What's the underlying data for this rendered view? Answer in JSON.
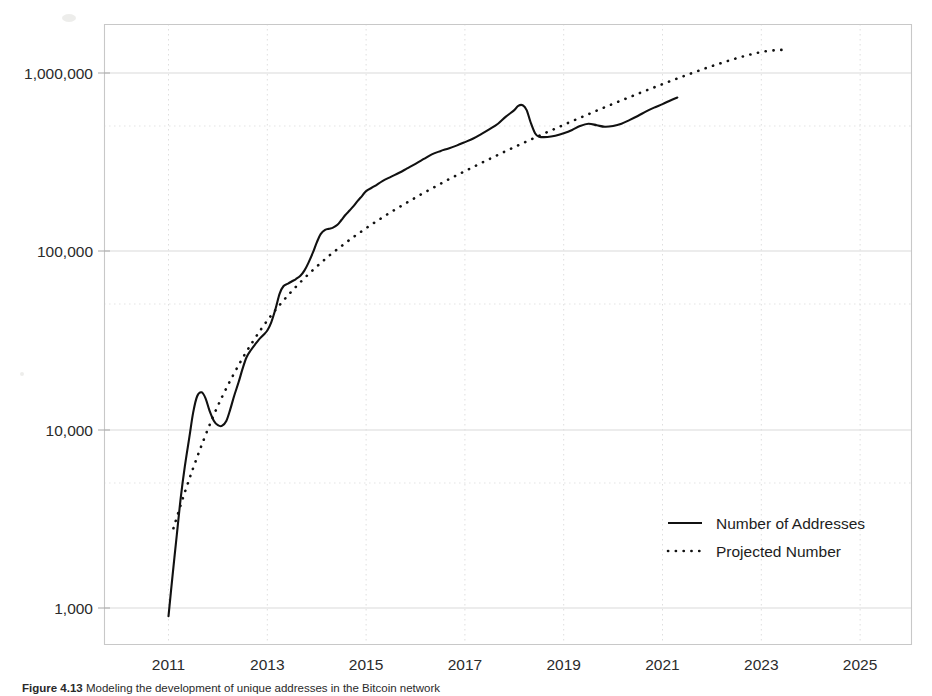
{
  "figure": {
    "caption_label": "Figure 4.13",
    "caption_body": "Modeling the development of unique addresses in the Bitcoin network"
  },
  "legend": {
    "position": "inside-bottom-right",
    "entries": [
      {
        "label": "Number of Addresses",
        "style": "solid",
        "color": "#111111"
      },
      {
        "label": "Projected Number",
        "style": "dotted",
        "color": "#111111"
      }
    ]
  },
  "chart_data": {
    "type": "line",
    "title": "",
    "xlabel": "",
    "ylabel": "",
    "yscale": "log",
    "grid": true,
    "legend_position": "inside-bottom-right",
    "xlim": [
      2010.2,
      2026.0
    ],
    "ylim": [
      620,
      2300000
    ],
    "xticks": [
      "2011",
      "2013",
      "2015",
      "2017",
      "2019",
      "2021",
      "2023",
      "2025"
    ],
    "xtick_values": [
      2011,
      2013,
      2015,
      2017,
      2019,
      2021,
      2023,
      2025
    ],
    "ytick_labels": [
      "1,000",
      "10,000",
      "100,000",
      "1,000,000"
    ],
    "ytick_values": [
      1000,
      10000,
      100000,
      1000000
    ],
    "series": [
      {
        "name": "Number of Addresses",
        "style": "solid",
        "color": "#111111",
        "x": [
          2011.0,
          2011.08,
          2011.17,
          2011.25,
          2011.33,
          2011.42,
          2011.5,
          2011.58,
          2011.67,
          2011.75,
          2011.83,
          2011.92,
          2012.0,
          2012.08,
          2012.17,
          2012.25,
          2012.33,
          2012.42,
          2012.5,
          2012.58,
          2012.67,
          2012.75,
          2012.83,
          2012.92,
          2013.0,
          2013.08,
          2013.17,
          2013.25,
          2013.33,
          2013.42,
          2013.5,
          2013.58,
          2013.67,
          2013.75,
          2013.83,
          2013.92,
          2014.0,
          2014.08,
          2014.17,
          2014.25,
          2014.33,
          2014.42,
          2014.5,
          2014.58,
          2014.67,
          2014.75,
          2014.83,
          2014.92,
          2015.0,
          2015.17,
          2015.33,
          2015.5,
          2015.67,
          2015.83,
          2016.0,
          2016.17,
          2016.33,
          2016.5,
          2016.67,
          2016.83,
          2017.0,
          2017.17,
          2017.33,
          2017.5,
          2017.67,
          2017.83,
          2018.0,
          2018.08,
          2018.17,
          2018.25,
          2018.33,
          2018.42,
          2018.5,
          2018.67,
          2018.83,
          2019.0,
          2019.17,
          2019.33,
          2019.5,
          2019.67,
          2019.83,
          2020.0,
          2020.17,
          2020.33,
          2020.5,
          2020.67,
          2020.83,
          2021.0,
          2021.17,
          2021.3
        ],
        "y": [
          900,
          1500,
          2600,
          4200,
          6200,
          9000,
          12500,
          15400,
          16200,
          15000,
          12800,
          11200,
          10600,
          10500,
          11200,
          13000,
          15500,
          18500,
          22000,
          25500,
          28000,
          30000,
          32000,
          34000,
          36000,
          40000,
          48000,
          58000,
          64000,
          66000,
          68000,
          70000,
          73000,
          78000,
          86000,
          98000,
          112000,
          125000,
          132000,
          134000,
          136000,
          141000,
          150000,
          160000,
          170000,
          180000,
          192000,
          205000,
          218000,
          232000,
          248000,
          262000,
          276000,
          292000,
          310000,
          330000,
          350000,
          365000,
          378000,
          392000,
          410000,
          430000,
          455000,
          485000,
          520000,
          570000,
          620000,
          655000,
          660000,
          620000,
          530000,
          460000,
          440000,
          438000,
          445000,
          460000,
          480000,
          505000,
          520000,
          510000,
          500000,
          505000,
          520000,
          545000,
          575000,
          610000,
          640000,
          670000,
          705000,
          730000
        ]
      },
      {
        "name": "Projected Number",
        "style": "dotted",
        "color": "#111111",
        "x": [
          2011.1,
          2011.3,
          2011.5,
          2011.7,
          2011.9,
          2012.1,
          2012.3,
          2012.5,
          2012.7,
          2012.9,
          2013.1,
          2013.3,
          2013.5,
          2013.7,
          2013.9,
          2014.1,
          2014.3,
          2014.5,
          2014.7,
          2014.9,
          2015.1,
          2015.3,
          2015.5,
          2015.7,
          2015.9,
          2016.1,
          2016.3,
          2016.5,
          2016.7,
          2016.9,
          2017.1,
          2017.3,
          2017.5,
          2017.7,
          2017.9,
          2018.1,
          2018.3,
          2018.5,
          2018.7,
          2018.9,
          2019.1,
          2019.3,
          2019.5,
          2019.7,
          2019.9,
          2020.1,
          2020.3,
          2020.5,
          2020.7,
          2020.9,
          2021.1,
          2021.3,
          2021.5,
          2021.7,
          2021.9,
          2022.1,
          2022.3,
          2022.5,
          2022.7,
          2022.9,
          2023.1,
          2023.3,
          2023.45
        ],
        "y": [
          2800,
          4200,
          6100,
          8600,
          11800,
          15600,
          20000,
          25200,
          31000,
          37500,
          44500,
          52000,
          60000,
          68500,
          77500,
          87000,
          97000,
          107000,
          118000,
          129000,
          141000,
          153000,
          166000,
          179000,
          193000,
          208000,
          223000,
          239000,
          256000,
          273000,
          291000,
          310000,
          330000,
          351000,
          373000,
          396000,
          420000,
          445000,
          471000,
          498000,
          527000,
          557000,
          588000,
          621000,
          655000,
          690000,
          727000,
          765000,
          805000,
          846000,
          889000,
          933000,
          978000,
          1024000,
          1071000,
          1118000,
          1165000,
          1211000,
          1255000,
          1295000,
          1327000,
          1345000,
          1350000
        ]
      }
    ]
  },
  "axes_geometry": {
    "plot_left": 104,
    "plot_right": 912,
    "plot_top": 24,
    "plot_bottom": 645,
    "x_at_2011": 168.5,
    "x_per_year": 49.4,
    "y_at_1000": 608,
    "px_per_decade": 178.3
  }
}
